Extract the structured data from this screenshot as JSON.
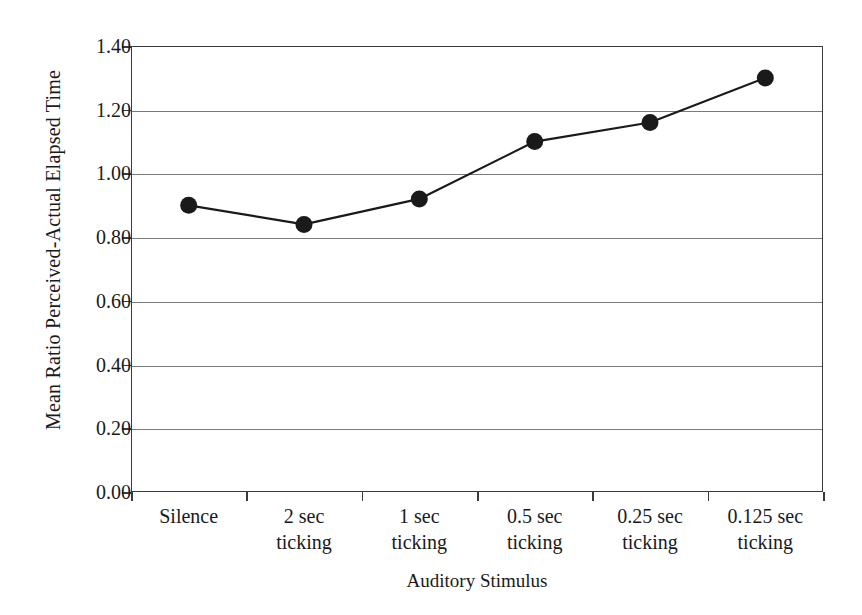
{
  "chart_data": {
    "type": "line",
    "title": "",
    "xlabel": "Auditory Stimulus",
    "ylabel": "Mean Ratio Perceived-Actual Elapsed Time",
    "categories": [
      "Silence",
      "2 sec ticking",
      "1 sec ticking",
      "0.5 sec ticking",
      "0.25 sec ticking",
      "0.125 sec ticking"
    ],
    "category_lines": [
      [
        "Silence",
        ""
      ],
      [
        "2 sec",
        "ticking"
      ],
      [
        "1 sec",
        "ticking"
      ],
      [
        "0.5 sec",
        "ticking"
      ],
      [
        "0.25 sec",
        "ticking"
      ],
      [
        "0.125 sec",
        "ticking"
      ]
    ],
    "values": [
      0.9,
      0.84,
      0.92,
      1.1,
      1.16,
      1.3
    ],
    "ylim": [
      0.0,
      1.4
    ],
    "ytick_values": [
      0.0,
      0.2,
      0.4,
      0.6,
      0.8,
      1.0,
      1.2,
      1.4
    ],
    "ytick_labels": [
      "0.00",
      "0.20",
      "0.40",
      "0.60",
      "0.80",
      "1.00",
      "1.20",
      "1.40"
    ],
    "grid": "horizontal",
    "legend": "none",
    "marker": "filled-circle",
    "series_color": "#1a1a1a",
    "gridline_color": "#7a7a7a",
    "axis_color": "#3a3a3a",
    "background_color": "#ffffff"
  },
  "axes": {
    "y_title": "Mean Ratio Perceived-Actual Elapsed Time",
    "x_title": "Auditory Stimulus"
  }
}
